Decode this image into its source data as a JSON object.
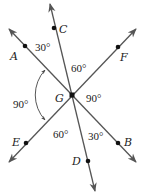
{
  "diagram": {
    "type": "intersecting-lines-angle-figure",
    "center_point": {
      "label": "G"
    },
    "lines": [
      {
        "name": "line-CD",
        "points": [
          "C",
          "G",
          "D"
        ]
      },
      {
        "name": "line-AB",
        "points": [
          "A",
          "G",
          "B"
        ]
      },
      {
        "name": "line-FE",
        "points": [
          "F",
          "G",
          "E"
        ]
      }
    ],
    "point_labels": {
      "A": "A",
      "B": "B",
      "C": "C",
      "D": "D",
      "E": "E",
      "F": "F",
      "G": "G"
    },
    "angles": [
      {
        "between": [
          "A",
          "C"
        ],
        "label": "30°"
      },
      {
        "between": [
          "C",
          "F"
        ],
        "label": "60°"
      },
      {
        "between": [
          "F",
          "B"
        ],
        "label": "90°"
      },
      {
        "between": [
          "A",
          "E"
        ],
        "label": "90°",
        "marked_with_arc": true
      },
      {
        "between": [
          "E",
          "D"
        ],
        "label": "60°"
      },
      {
        "between": [
          "D",
          "B"
        ],
        "label": "30°"
      }
    ],
    "colors": {
      "line": "#555555",
      "point": "#111111",
      "text": "#222222",
      "background": "#ffffff"
    }
  }
}
